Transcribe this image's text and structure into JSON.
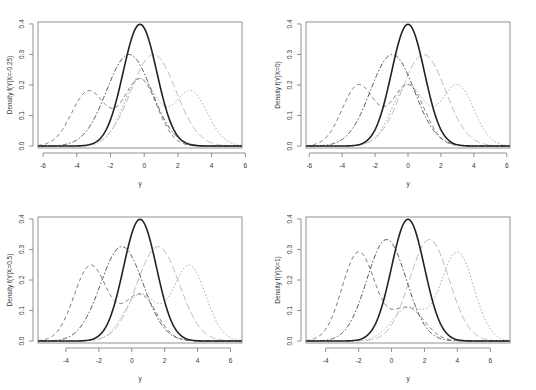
{
  "figure": {
    "layout": "2x2 grid",
    "legend": "none"
  },
  "chart_data": [
    {
      "type": "line",
      "title": "",
      "xlabel": "y",
      "ylabel": "Density f(Y|X=-0.25)",
      "xlim": [
        -6.3,
        5.8
      ],
      "ylim": [
        0,
        0.4
      ],
      "xticks": [
        -6,
        -4,
        -2,
        0,
        2,
        4,
        6
      ],
      "yticks": [
        "0.0",
        "0.1",
        "0.2",
        "0.3",
        "0.4"
      ],
      "grid": false,
      "series": [
        {
          "name": "solid",
          "style": "solid",
          "color": "#222222",
          "width": 1.6,
          "components": [
            [
              1.0,
              -0.25,
              1.0
            ]
          ]
        },
        {
          "name": "dot-dash",
          "style": "dotdash",
          "color": "#555555",
          "width": 1.0,
          "components": [
            [
              1.0,
              -0.9,
              1.33
            ]
          ]
        },
        {
          "name": "long-dash",
          "style": "longdash",
          "color": "#bbbbbb",
          "width": 1.0,
          "components": [
            [
              1.0,
              0.55,
              1.33
            ]
          ]
        },
        {
          "name": "dashed",
          "style": "dashed",
          "color": "#777777",
          "width": 1.0,
          "components": [
            [
              0.45,
              -3.3,
              1.0
            ],
            [
              0.55,
              -0.25,
              1.0
            ]
          ]
        },
        {
          "name": "dotted",
          "style": "dotted",
          "color": "#aaaaaa",
          "width": 1.0,
          "components": [
            [
              0.55,
              -0.25,
              1.0
            ],
            [
              0.45,
              2.75,
              1.0
            ]
          ]
        }
      ]
    },
    {
      "type": "line",
      "title": "",
      "xlabel": "y",
      "ylabel": "Density f(Y|X=0)",
      "xlim": [
        -6.2,
        6.2
      ],
      "ylim": [
        0,
        0.4
      ],
      "xticks": [
        -6,
        -4,
        -2,
        0,
        2,
        4,
        6
      ],
      "yticks": [
        "0.0",
        "0.1",
        "0.2",
        "0.3",
        "0.4"
      ],
      "grid": false,
      "series": [
        {
          "name": "solid",
          "style": "solid",
          "color": "#222222",
          "width": 1.6,
          "components": [
            [
              1.0,
              0.0,
              1.0
            ]
          ]
        },
        {
          "name": "dot-dash",
          "style": "dotdash",
          "color": "#555555",
          "width": 1.0,
          "components": [
            [
              1.0,
              -0.95,
              1.33
            ]
          ]
        },
        {
          "name": "long-dash",
          "style": "longdash",
          "color": "#bbbbbb",
          "width": 1.0,
          "components": [
            [
              1.0,
              0.95,
              1.33
            ]
          ]
        },
        {
          "name": "dashed",
          "style": "dashed",
          "color": "#777777",
          "width": 1.0,
          "components": [
            [
              0.5,
              -3.0,
              1.0
            ],
            [
              0.5,
              0.0,
              1.0
            ]
          ]
        },
        {
          "name": "dotted",
          "style": "dotted",
          "color": "#aaaaaa",
          "width": 1.0,
          "components": [
            [
              0.5,
              0.0,
              1.0
            ],
            [
              0.5,
              3.0,
              1.0
            ]
          ]
        }
      ]
    },
    {
      "type": "line",
      "title": "",
      "xlabel": "y",
      "ylabel": "Density f(Y|X=0.5)",
      "xlim": [
        -5.7,
        6.7
      ],
      "ylim": [
        0,
        0.4
      ],
      "xticks": [
        -4,
        -2,
        0,
        2,
        4,
        6
      ],
      "yticks": [
        "0.0",
        "0.1",
        "0.2",
        "0.3",
        "0.4"
      ],
      "grid": false,
      "series": [
        {
          "name": "solid",
          "style": "solid",
          "color": "#222222",
          "width": 1.6,
          "components": [
            [
              1.0,
              0.5,
              1.0
            ]
          ]
        },
        {
          "name": "dot-dash",
          "style": "dotdash",
          "color": "#555555",
          "width": 1.0,
          "components": [
            [
              1.0,
              -0.6,
              1.29
            ]
          ]
        },
        {
          "name": "long-dash",
          "style": "longdash",
          "color": "#bbbbbb",
          "width": 1.0,
          "components": [
            [
              1.0,
              1.6,
              1.29
            ]
          ]
        },
        {
          "name": "dashed",
          "style": "dashed",
          "color": "#777777",
          "width": 1.0,
          "components": [
            [
              0.62,
              -2.5,
              1.0
            ],
            [
              0.38,
              0.5,
              1.0
            ]
          ]
        },
        {
          "name": "dotted",
          "style": "dotted",
          "color": "#aaaaaa",
          "width": 1.0,
          "components": [
            [
              0.38,
              0.5,
              1.0
            ],
            [
              0.62,
              3.5,
              1.0
            ]
          ]
        }
      ]
    },
    {
      "type": "line",
      "title": "",
      "xlabel": "y",
      "ylabel": "Density f(Y|X=1)",
      "xlim": [
        -5.2,
        7.2
      ],
      "ylim": [
        0,
        0.4
      ],
      "xticks": [
        -4,
        -2,
        0,
        2,
        4,
        6
      ],
      "yticks": [
        "0.0",
        "0.1",
        "0.2",
        "0.3",
        "0.4"
      ],
      "grid": false,
      "series": [
        {
          "name": "solid",
          "style": "solid",
          "color": "#222222",
          "width": 1.6,
          "components": [
            [
              1.0,
              1.0,
              1.0
            ]
          ]
        },
        {
          "name": "dot-dash",
          "style": "dotdash",
          "color": "#555555",
          "width": 1.0,
          "components": [
            [
              1.0,
              -0.3,
              1.2
            ]
          ]
        },
        {
          "name": "long-dash",
          "style": "longdash",
          "color": "#bbbbbb",
          "width": 1.0,
          "components": [
            [
              1.0,
              2.3,
              1.2
            ]
          ]
        },
        {
          "name": "dashed",
          "style": "dashed",
          "color": "#777777",
          "width": 1.0,
          "components": [
            [
              0.73,
              -2.0,
              1.0
            ],
            [
              0.27,
              1.0,
              1.0
            ]
          ]
        },
        {
          "name": "dotted",
          "style": "dotted",
          "color": "#aaaaaa",
          "width": 1.0,
          "components": [
            [
              0.27,
              1.0,
              1.0
            ],
            [
              0.73,
              4.0,
              1.0
            ]
          ]
        }
      ]
    }
  ]
}
